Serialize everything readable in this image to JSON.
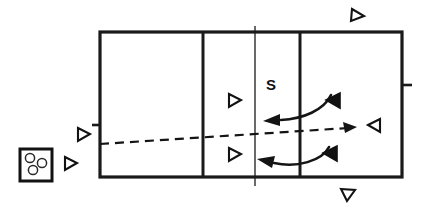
{
  "diagram": {
    "type": "sports-play-diagram",
    "sport": "volleyball",
    "background_color": "#ffffff",
    "line_color": "#1a1a1a",
    "canvas": {
      "width": 426,
      "height": 214
    }
  },
  "court": {
    "name": "volleyball-court",
    "left": 100,
    "top": 32,
    "right": 402,
    "bottom": 177,
    "border_width": 3.2,
    "division_lines_x": [
      203,
      300
    ],
    "net_line_x": 255,
    "net_overhang_top": 26,
    "net_overhang_bottom": 186,
    "side_ticks": [
      {
        "name": "left-sideline-tick",
        "x_from": 92,
        "x_to": 100,
        "y": 125
      },
      {
        "name": "right-sideline-tick",
        "x_from": 402,
        "x_to": 412,
        "y": 85
      }
    ]
  },
  "labels": [
    {
      "name": "setter-position-label",
      "text": "S",
      "x": 271,
      "y": 86
    }
  ],
  "ball_cart": {
    "name": "ball-cart",
    "x": 20,
    "y": 149,
    "width": 32,
    "height": 32,
    "ball_count": 3,
    "balls": [
      {
        "cx": 30,
        "cy": 158,
        "r": 4.6
      },
      {
        "cx": 42,
        "cy": 163,
        "r": 4.6
      },
      {
        "cx": 33,
        "cy": 170,
        "r": 4.6
      }
    ]
  },
  "trajectory": {
    "name": "ball-flight-path",
    "style": "dashed",
    "points": [
      {
        "x": 100,
        "y": 144
      },
      {
        "x": 348,
        "y": 128
      }
    ],
    "arrowhead": "right",
    "arrow_tip_x": 356,
    "arrow_tip_y": 127
  },
  "motion_arcs": [
    {
      "name": "upper-transition-arc",
      "path": "M 330 96 C 322 108, 302 118, 280 121",
      "arrow_tip": {
        "x": 264,
        "y": 121
      },
      "direction": "left"
    },
    {
      "name": "lower-transition-arc",
      "path": "M 328 148 C 320 160, 296 166, 272 163",
      "arrow_tip": {
        "x": 258,
        "y": 160
      },
      "direction": "left"
    }
  ],
  "markers": [
    {
      "name": "player-marker-outside-left-upper",
      "shape": "triangle-open-right",
      "x": 83,
      "y": 134,
      "size": 11
    },
    {
      "name": "player-marker-outside-left-lower",
      "shape": "triangle-open-right",
      "x": 70,
      "y": 163,
      "size": 11
    },
    {
      "name": "player-marker-court-upper",
      "shape": "triangle-open-right",
      "x": 234,
      "y": 100,
      "size": 11
    },
    {
      "name": "player-marker-court-lower",
      "shape": "triangle-open-right",
      "x": 234,
      "y": 154,
      "size": 11
    },
    {
      "name": "player-marker-top-right-outside",
      "shape": "triangle-open-right",
      "x": 357,
      "y": 15,
      "size": 11
    },
    {
      "name": "player-marker-bottom-right-outside",
      "shape": "triangle-open-right",
      "x": 347,
      "y": 196,
      "size": 11
    },
    {
      "name": "player-marker-right-open",
      "shape": "triangle-open-left",
      "x": 374,
      "y": 125,
      "size": 11
    },
    {
      "name": "player-marker-blocker-upper",
      "shape": "triangle-filled-left",
      "x": 334,
      "y": 100,
      "size": 12
    },
    {
      "name": "player-marker-blocker-lower",
      "shape": "triangle-filled-left",
      "x": 331,
      "y": 153,
      "size": 12
    }
  ],
  "legend_semantics": {
    "open_triangle": "player (unshaded)",
    "filled_triangle": "player (shaded / opposing or active role)",
    "dashed_line": "ball trajectory",
    "curved_arrow": "player movement",
    "S": "setter"
  }
}
